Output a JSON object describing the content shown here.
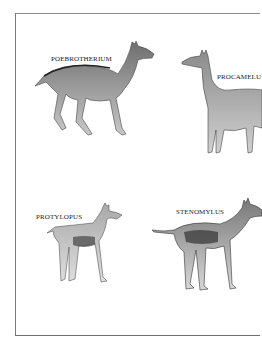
{
  "page": {
    "type": "illustration-plate",
    "background": "#ffffff",
    "frame_color": "#7a7a7a"
  },
  "specimens": [
    {
      "label": "POEBROTHERIUM",
      "position": "top-left"
    },
    {
      "label": "PROCAMELU",
      "position": "top-right"
    },
    {
      "label": "PROTYLOPUS",
      "position": "bottom-left"
    },
    {
      "label": "STENOMYLUS",
      "position": "bottom-right"
    }
  ]
}
